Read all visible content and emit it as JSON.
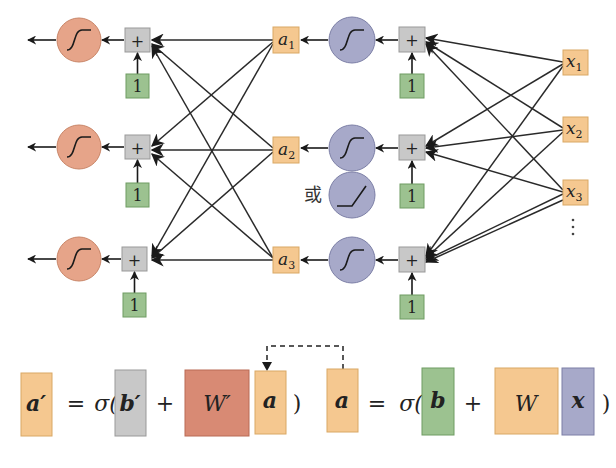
{
  "diagram": {
    "colors": {
      "output_neuron": "#e6a489",
      "hidden_neuron": "#a7a9c9",
      "activation_box": "#f5c890",
      "sum_box": "#c8c8c8",
      "bias_box": "#9cc290",
      "weight_W_prime": "#d88a74",
      "weight_W": "#f5c890",
      "input_x": "#a7a9c9",
      "edge": "#222222"
    },
    "output_layer": {
      "neurons": [
        {
          "activation": "sigmoid"
        },
        {
          "activation": "sigmoid"
        },
        {
          "activation": "sigmoid"
        }
      ],
      "sum_symbol": "+",
      "bias_value": "1"
    },
    "hidden_layer": {
      "activations": [
        {
          "label": "a",
          "sub": "1"
        },
        {
          "label": "a",
          "sub": "2"
        },
        {
          "label": "a",
          "sub": "3"
        }
      ],
      "neurons": [
        {
          "activation": "sigmoid"
        },
        {
          "activation": "sigmoid"
        },
        {
          "activation": "sigmoid"
        }
      ],
      "alt_activation": "relu",
      "alt_label": "或",
      "sum_symbol": "+",
      "bias_value": "1"
    },
    "input_layer": {
      "inputs": [
        {
          "label": "x",
          "sub": "1"
        },
        {
          "label": "x",
          "sub": "2"
        },
        {
          "label": "x",
          "sub": "3"
        }
      ],
      "ellipsis": "⋮"
    },
    "equations": {
      "left": {
        "lhs": "a′",
        "equals": "=",
        "sigma_open": "σ(",
        "bias": "b′",
        "plus": "+",
        "weight": "W′",
        "input": "a",
        "close": ")"
      },
      "right": {
        "lhs": "a",
        "equals": "=",
        "sigma_open": "σ(",
        "bias": "b",
        "plus": "+",
        "weight": "W",
        "input": "x",
        "close": ")"
      }
    }
  }
}
